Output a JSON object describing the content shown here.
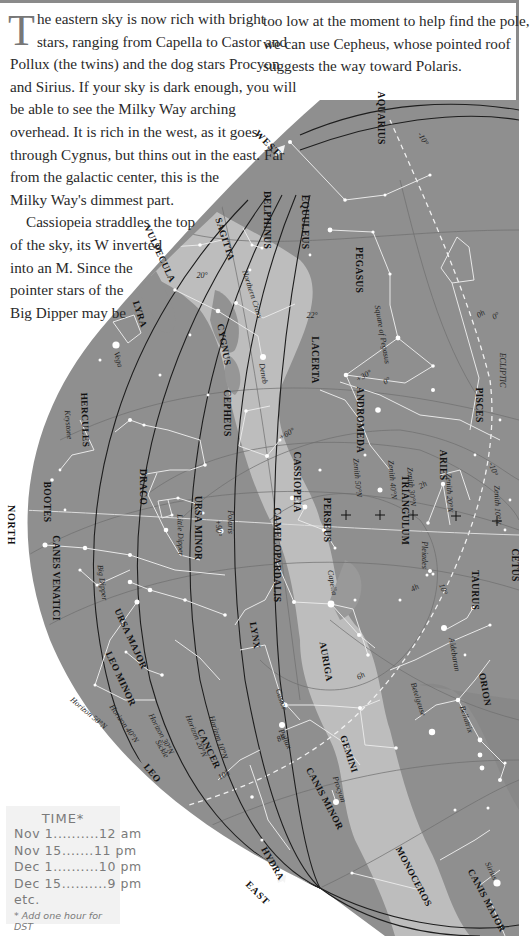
{
  "text": {
    "dropcap": "T",
    "left_lines": [
      "he eastern sky is now rich with bright",
      "stars, ranging from Capella to Castor and",
      "Pollux (the twins) and the dog stars Procyon",
      "and Sirius. If your sky is dark enough, you will",
      "be able to see the Milky Way arching",
      "overhead. It is rich in the west, as it goes",
      "through Cygnus, but thins out in the east. Far",
      "from the galactic center, this is the",
      "Milky Way's dimmest part.",
      "Cassiopeia straddles the top",
      "of the sky, its W inverted",
      "into an M. Since the",
      "pointer stars of the",
      "Big Dipper may be"
    ],
    "right_lines": [
      "too low at the moment to help find the pole,",
      "we can use Cepheus, whose pointed roof",
      "suggests the way toward Polaris."
    ]
  },
  "time_box": {
    "title": "TIME*",
    "rows": [
      {
        "date": "Nov 1",
        "dots": "..........",
        "time": "12 am"
      },
      {
        "date": "Nov 15",
        "dots": ".......",
        "time": "11 pm"
      },
      {
        "date": "Dec 1",
        "dots": "..........",
        "time": "10 pm"
      },
      {
        "date": "Dec 15",
        "dots": "..........",
        "time": "9 pm"
      }
    ],
    "etc": "etc.",
    "note": "* Add one hour for DST"
  },
  "map": {
    "directions": {
      "west": "WEST",
      "north": "NORTH",
      "east": "EAST"
    },
    "constellations": [
      {
        "name": "AQUARIUS",
        "x": 378,
        "y": 118,
        "rot": 90
      },
      {
        "name": "DELPHINUS",
        "x": 264,
        "y": 220,
        "rot": 90
      },
      {
        "name": "EQUULEUS",
        "x": 302,
        "y": 222,
        "rot": 90
      },
      {
        "name": "SAGITTA",
        "x": 222,
        "y": 240,
        "rot": 72
      },
      {
        "name": "VULPECULA",
        "x": 157,
        "y": 255,
        "rot": 65
      },
      {
        "name": "PEGASUS",
        "x": 356,
        "y": 270,
        "rot": 90
      },
      {
        "name": "LYRA",
        "x": 137,
        "y": 315,
        "rot": 72
      },
      {
        "name": "CYGNUS",
        "x": 221,
        "y": 345,
        "rot": 80
      },
      {
        "name": "HERCULES",
        "x": 82,
        "y": 420,
        "rot": 88
      },
      {
        "name": "LACERTA",
        "x": 312,
        "y": 360,
        "rot": 90
      },
      {
        "name": "ANDROMEDA",
        "x": 357,
        "y": 420,
        "rot": 90
      },
      {
        "name": "CEPHEUS",
        "x": 224,
        "y": 413,
        "rot": 90
      },
      {
        "name": "PISCES",
        "x": 476,
        "y": 405,
        "rot": 90
      },
      {
        "name": "ARIES",
        "x": 440,
        "y": 465,
        "rot": 90
      },
      {
        "name": "CASSIOPEIA",
        "x": 294,
        "y": 482,
        "rot": 90
      },
      {
        "name": "DRACO",
        "x": 140,
        "y": 487,
        "rot": 90
      },
      {
        "name": "BOOTES",
        "x": 44,
        "y": 502,
        "rot": 90
      },
      {
        "name": "URSA MINOR",
        "x": 195,
        "y": 528,
        "rot": 90
      },
      {
        "name": "CAMELOPARDALIS",
        "x": 274,
        "y": 555,
        "rot": 90
      },
      {
        "name": "PERSEUS",
        "x": 324,
        "y": 520,
        "rot": 90
      },
      {
        "name": "TRIANGULUM",
        "x": 402,
        "y": 510,
        "rot": 90
      },
      {
        "name": "CETUS",
        "x": 512,
        "y": 565,
        "rot": 90
      },
      {
        "name": "TAURUS",
        "x": 472,
        "y": 590,
        "rot": 90
      },
      {
        "name": "CANES VENATICI",
        "x": 53,
        "y": 578,
        "rot": 90
      },
      {
        "name": "LYNX",
        "x": 252,
        "y": 636,
        "rot": 80
      },
      {
        "name": "AURIGA",
        "x": 323,
        "y": 662,
        "rot": 80
      },
      {
        "name": "URSA MAJOR",
        "x": 128,
        "y": 640,
        "rot": 65
      },
      {
        "name": "LEO MINOR",
        "x": 118,
        "y": 680,
        "rot": 65
      },
      {
        "name": "ORION",
        "x": 482,
        "y": 690,
        "rot": 80
      },
      {
        "name": "CANCER",
        "x": 206,
        "y": 750,
        "rot": 65
      },
      {
        "name": "GEMINI",
        "x": 346,
        "y": 755,
        "rot": 72
      },
      {
        "name": "LEO",
        "x": 150,
        "y": 775,
        "rot": 50
      },
      {
        "name": "CANIS MINOR",
        "x": 322,
        "y": 800,
        "rot": 62
      },
      {
        "name": "HYDRA",
        "x": 270,
        "y": 865,
        "rot": 60
      },
      {
        "name": "MONOCEROS",
        "x": 411,
        "y": 878,
        "rot": 62
      },
      {
        "name": "CANIS MAJOR",
        "x": 484,
        "y": 902,
        "rot": 62
      }
    ],
    "stars_named": [
      {
        "name": "Vega",
        "x": 116,
        "y": 360,
        "rot": 75
      },
      {
        "name": "Deneb",
        "x": 261,
        "y": 374,
        "rot": 80
      },
      {
        "name": "Polaris",
        "x": 228,
        "y": 522,
        "rot": 90
      },
      {
        "name": "Capella",
        "x": 330,
        "y": 583,
        "rot": 80
      },
      {
        "name": "Pleiades",
        "x": 422,
        "y": 555,
        "rot": 90
      },
      {
        "name": "Aldebaran",
        "x": 452,
        "y": 655,
        "rot": 80
      },
      {
        "name": "Castor",
        "x": 279,
        "y": 700,
        "rot": 72
      },
      {
        "name": "Pollux",
        "x": 283,
        "y": 740,
        "rot": 65
      },
      {
        "name": "Betelgeuse",
        "x": 416,
        "y": 700,
        "rot": 72
      },
      {
        "name": "Bellatrix",
        "x": 464,
        "y": 720,
        "rot": 72
      },
      {
        "name": "Procyon",
        "x": 337,
        "y": 790,
        "rot": 72
      },
      {
        "name": "Sirius",
        "x": 489,
        "y": 872,
        "rot": 65
      }
    ],
    "annotations": [
      {
        "text": "Northern Cross",
        "x": 250,
        "y": 295,
        "rot": 72
      },
      {
        "text": "Square of Pegasus",
        "x": 380,
        "y": 335,
        "rot": 80
      },
      {
        "text": "Keystone",
        "x": 66,
        "y": 425,
        "rot": 85
      },
      {
        "text": "Little Dipper",
        "x": 178,
        "y": 535,
        "rot": 88
      },
      {
        "text": "Big Dipper",
        "x": 100,
        "y": 583,
        "rot": 82
      },
      {
        "text": "ECLIPTIC",
        "x": 500,
        "y": 370,
        "rot": 90
      },
      {
        "text": "Sickle",
        "x": 160,
        "y": 750,
        "rot": 60
      },
      {
        "text": "Zenith 50°N",
        "x": 355,
        "y": 478,
        "rot": 85
      },
      {
        "text": "Zenith 40°N",
        "x": 390,
        "y": 480,
        "rot": 85
      },
      {
        "text": "Zenith 30°N",
        "x": 409,
        "y": 487,
        "rot": 85
      },
      {
        "text": "Zenith 20°N",
        "x": 447,
        "y": 493,
        "rot": 88
      },
      {
        "text": "Zenith 10°N",
        "x": 495,
        "y": 505,
        "rot": 88
      },
      {
        "text": "Horizon 50°N",
        "x": 87,
        "y": 715,
        "rot": 40
      },
      {
        "text": "Horizon 40°N",
        "x": 122,
        "y": 725,
        "rot": 55
      },
      {
        "text": "Horizon 30°N",
        "x": 159,
        "y": 735,
        "rot": 62
      },
      {
        "text": "Horizon 20°N",
        "x": 194,
        "y": 737,
        "rot": 68
      },
      {
        "text": "Horizon 10°N",
        "x": 216,
        "y": 738,
        "rot": 72
      }
    ],
    "degree_labels": [
      {
        "text": "-10°",
        "x": 421,
        "y": 140,
        "rot": 60
      },
      {
        "text": "20°",
        "x": 202,
        "y": 278,
        "rot": 0
      },
      {
        "text": "22°",
        "x": 312,
        "y": 318,
        "rot": 0
      },
      {
        "text": "0h",
        "x": 482,
        "y": 316,
        "rot": -30
      },
      {
        "text": "0°",
        "x": 497,
        "y": 318,
        "rot": -30
      },
      {
        "text": "+30°",
        "x": 365,
        "y": 378,
        "rot": -30
      },
      {
        "text": "0°",
        "x": 388,
        "y": 383,
        "rot": -30
      },
      {
        "text": "+60°",
        "x": 288,
        "y": 436,
        "rot": -30
      },
      {
        "text": "+90°",
        "x": 216,
        "y": 528,
        "rot": 90
      },
      {
        "text": "2h",
        "x": 424,
        "y": 487,
        "rot": -30
      },
      {
        "text": "4h",
        "x": 416,
        "y": 590,
        "rot": -30
      },
      {
        "text": "6h",
        "x": 362,
        "y": 678,
        "rot": -30
      },
      {
        "text": "8h",
        "x": 282,
        "y": 740,
        "rot": -30
      },
      {
        "text": "10h",
        "x": 225,
        "y": 777,
        "rot": -30
      },
      {
        "text": "-10°",
        "x": 491,
        "y": 470,
        "rot": 70
      },
      {
        "text": "10°",
        "x": 441,
        "y": 590,
        "rot": 70
      }
    ]
  },
  "colors": {
    "sky": "#8f8f8f",
    "milky_way": "#bdbdbd",
    "milky_way_bright": "#cccccc",
    "dark_lane": "#7d7d7d",
    "line": "#e8e8e8",
    "grid": "#6f6f6f",
    "horizon": "#1e1e1e"
  }
}
